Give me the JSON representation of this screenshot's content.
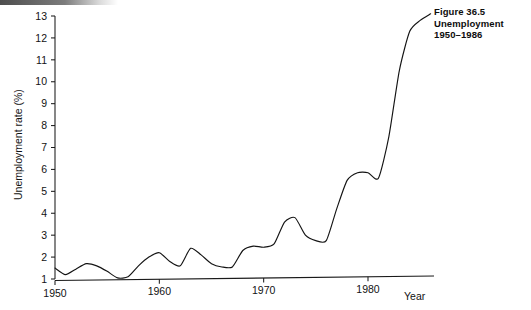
{
  "caption": {
    "line1": "Figure 36.5",
    "line2": "Unemployment",
    "line3": "1950–1986"
  },
  "chart_data": {
    "type": "line",
    "title": "Unemployment 1950–1986",
    "xlabel": "Year",
    "ylabel": "Unemployment rate (%)",
    "xlim": [
      1950,
      1986
    ],
    "ylim": [
      1,
      13
    ],
    "grid": false,
    "legend": "none",
    "xticks": [
      1950,
      1960,
      1970,
      1980
    ],
    "xtick_labels": [
      "1950",
      "1960",
      "1970",
      "1980"
    ],
    "yticks": [
      1,
      2,
      3,
      4,
      5,
      6,
      7,
      8,
      9,
      10,
      11,
      12,
      13
    ],
    "ytick_labels": [
      "1",
      "2",
      "3",
      "4",
      "5",
      "6",
      "7",
      "8",
      "9",
      "10",
      "11",
      "12",
      "13"
    ],
    "x": [
      1950,
      1951,
      1952,
      1953,
      1954,
      1955,
      1956,
      1957,
      1958,
      1959,
      1960,
      1961,
      1962,
      1963,
      1964,
      1965,
      1966,
      1967,
      1968,
      1969,
      1970,
      1971,
      1972,
      1973,
      1974,
      1975,
      1976,
      1977,
      1978,
      1979,
      1980,
      1981,
      1982,
      1983,
      1984,
      1985,
      1986
    ],
    "values": [
      1.5,
      1.2,
      1.45,
      1.7,
      1.6,
      1.35,
      1.05,
      1.1,
      1.6,
      2.0,
      2.2,
      1.8,
      1.6,
      2.4,
      2.1,
      1.7,
      1.55,
      1.55,
      2.3,
      2.5,
      2.45,
      2.6,
      3.6,
      3.8,
      3.0,
      2.75,
      2.75,
      4.2,
      5.5,
      5.85,
      5.85,
      5.6,
      7.5,
      10.5,
      12.3,
      12.8,
      13.1
    ],
    "series_name": "Unemployment rate",
    "line_color": "#141414",
    "annotations": []
  },
  "axis": {
    "year_label": "Year"
  }
}
